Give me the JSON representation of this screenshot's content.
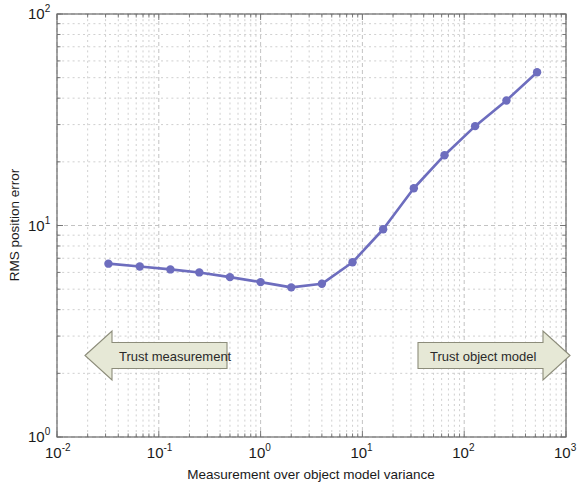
{
  "chart_data": {
    "type": "line",
    "title": "",
    "subtitle": "",
    "xlabel": "Measurement over object model variance",
    "ylabel": "RMS position error",
    "xscale": "log",
    "yscale": "log",
    "xlim": [
      0.01,
      1000
    ],
    "ylim": [
      1,
      100
    ],
    "grid": true,
    "grid_minor": true,
    "legend": null,
    "xtick_labels": [
      "10-2",
      "10-1",
      "100",
      "101",
      "102",
      "103"
    ],
    "xtick_mantissa": "10",
    "xtick_exponents": [
      "-2",
      "-1",
      "0",
      "1",
      "2",
      "3"
    ],
    "xticks": [
      0.01,
      0.1,
      1,
      10,
      100,
      1000
    ],
    "ytick_exponents": [
      "0",
      "1",
      "2"
    ],
    "yticks": [
      1,
      10,
      100
    ],
    "series": [
      {
        "name": "RMS position error",
        "color": "#6d6dbe",
        "marker": "circle",
        "x": [
          0.032,
          0.065,
          0.13,
          0.25,
          0.5,
          1.0,
          2.0,
          4.0,
          8.0,
          16.0,
          32.0,
          64.0,
          128.0,
          260.0,
          520.0
        ],
        "y": [
          6.6,
          6.4,
          6.2,
          6.0,
          5.7,
          5.4,
          5.1,
          5.3,
          6.7,
          9.6,
          15.0,
          21.5,
          29.5,
          39.0,
          53.0
        ]
      }
    ],
    "annotations": [
      {
        "name": "trust-measurement-arrow",
        "text": "Trust measurement",
        "direction": "left",
        "fill": "#e6e8d6",
        "stroke": "#8c8c7a"
      },
      {
        "name": "trust-object-model-arrow",
        "text": "Trust object model",
        "direction": "right",
        "fill": "#e6e8d6",
        "stroke": "#8c8c7a"
      }
    ]
  },
  "figure": {
    "background": "#ffffff",
    "axis_color": "#6b6b6b",
    "grid_color": "#bcbcbc"
  }
}
